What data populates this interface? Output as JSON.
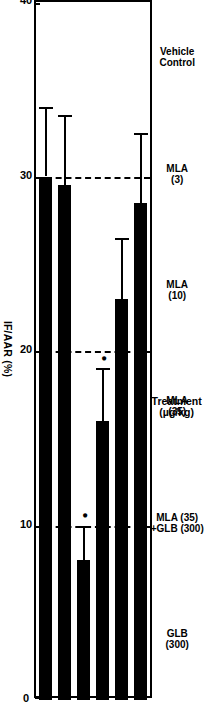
{
  "chart_data": {
    "type": "bar",
    "orientation": "horizontal-rotated",
    "title": "",
    "xlabel": "Treatment (µg/kg)",
    "ylabel": "IF/AAR (%)",
    "ylim": [
      0,
      40
    ],
    "yticks": [
      "0",
      "10",
      "20",
      "30",
      "40"
    ],
    "ytick_values": [
      0,
      10,
      20,
      30,
      40
    ],
    "grid": "dashed vertical gridlines at 10, 20, 30",
    "legend": "none",
    "categories": [
      "Vehicle\nControl",
      "MLA\n(3)",
      "MLA\n(10)",
      "MLA\n(35)",
      "MLA (35)\n+GLB (300)",
      "GLB\n(300)"
    ],
    "values": [
      28.5,
      23.0,
      16.0,
      8.0,
      29.5,
      30.0
    ],
    "errors": [
      4.0,
      3.5,
      3.0,
      2.0,
      4.0,
      4.0
    ],
    "significance": [
      "",
      "",
      "*",
      "*",
      "",
      ""
    ],
    "bar_color": "#000000",
    "axis_color": "#000000",
    "background": "#ffffff"
  },
  "axis": {
    "value_axis_label": "IF/AAR (%)",
    "category_axis_label": "Treatment\n(µg/kg)"
  },
  "ticks": [
    {
      "label": "0",
      "value": 0
    },
    {
      "label": "10",
      "value": 10
    },
    {
      "label": "20",
      "value": 20
    },
    {
      "label": "30",
      "value": 30
    },
    {
      "label": "40",
      "value": 40
    }
  ],
  "bars": [
    {
      "label": "Vehicle\nControl",
      "value": 28.5,
      "error": 4.0,
      "star": ""
    },
    {
      "label": "MLA\n(3)",
      "value": 23.0,
      "error": 3.5,
      "star": ""
    },
    {
      "label": "MLA\n(10)",
      "value": 16.0,
      "error": 3.0,
      "star": "•"
    },
    {
      "label": "MLA\n(35)",
      "value": 8.0,
      "error": 2.0,
      "star": "•"
    },
    {
      "label": "MLA (35)\n+GLB (300)",
      "value": 29.5,
      "error": 4.0,
      "star": ""
    },
    {
      "label": "GLB\n(300)",
      "value": 30.0,
      "error": 4.0,
      "star": ""
    }
  ]
}
